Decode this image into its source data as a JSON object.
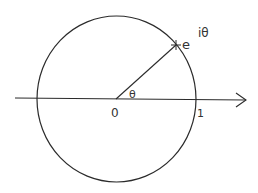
{
  "diagram": {
    "labels": {
      "origin": "0",
      "one": "1",
      "angle": "θ",
      "point_base": "e",
      "point_exponent": "iθ"
    },
    "colors": {
      "stroke": "#2b2b2b",
      "background": "#ffffff"
    }
  }
}
